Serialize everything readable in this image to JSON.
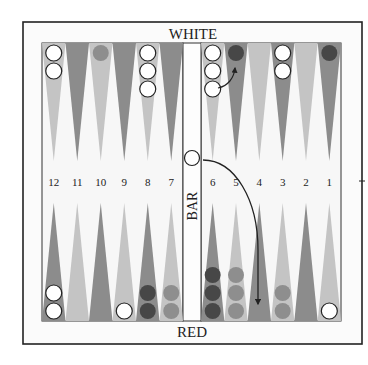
{
  "labels": {
    "top_player": "WHITE",
    "bottom_player": "RED",
    "bar": "BAR"
  },
  "point_numbers": [
    "12",
    "11",
    "10",
    "9",
    "8",
    "7",
    "6",
    "5",
    "4",
    "3",
    "2",
    "1"
  ],
  "colors": {
    "frame": "#222222",
    "board_bg": "#f7f7f7",
    "triangle_light": "#c4c4c4",
    "triangle_dark": "#8c8c8c",
    "checker_white": "#ffffff",
    "checker_dark": "#474747",
    "checker_gray": "#8e8e8e"
  },
  "top_points": [
    {
      "point": 13,
      "shade": "light",
      "checkers": {
        "color": "white",
        "count": 2
      }
    },
    {
      "point": 14,
      "shade": "dark",
      "checkers": {
        "color": "none",
        "count": 0
      }
    },
    {
      "point": 15,
      "shade": "light",
      "checkers": {
        "color": "gray",
        "count": 1
      }
    },
    {
      "point": 16,
      "shade": "dark",
      "checkers": {
        "color": "none",
        "count": 0
      }
    },
    {
      "point": 17,
      "shade": "light",
      "checkers": {
        "color": "white",
        "count": 3
      }
    },
    {
      "point": 18,
      "shade": "dark",
      "checkers": {
        "color": "none",
        "count": 0
      }
    },
    {
      "point": 19,
      "shade": "light",
      "checkers": {
        "color": "white",
        "count": 3
      }
    },
    {
      "point": 20,
      "shade": "dark",
      "checkers": {
        "color": "dark",
        "count": 1
      }
    },
    {
      "point": 21,
      "shade": "light",
      "checkers": {
        "color": "none",
        "count": 0
      }
    },
    {
      "point": 22,
      "shade": "dark",
      "checkers": {
        "color": "white",
        "count": 2
      }
    },
    {
      "point": 23,
      "shade": "light",
      "checkers": {
        "color": "none",
        "count": 0
      }
    },
    {
      "point": 24,
      "shade": "dark",
      "checkers": {
        "color": "dark",
        "count": 1
      }
    }
  ],
  "bottom_points": [
    {
      "point": 12,
      "shade": "dark",
      "checkers": {
        "color": "white",
        "count": 2
      }
    },
    {
      "point": 11,
      "shade": "light",
      "checkers": {
        "color": "none",
        "count": 0
      }
    },
    {
      "point": 10,
      "shade": "dark",
      "checkers": {
        "color": "none",
        "count": 0
      }
    },
    {
      "point": 9,
      "shade": "light",
      "checkers": {
        "color": "white",
        "count": 1
      }
    },
    {
      "point": 8,
      "shade": "dark",
      "checkers": {
        "color": "dark",
        "count": 2
      }
    },
    {
      "point": 7,
      "shade": "light",
      "checkers": {
        "color": "gray",
        "count": 2
      }
    },
    {
      "point": 6,
      "shade": "dark",
      "checkers": {
        "color": "dark",
        "count": 3
      }
    },
    {
      "point": 5,
      "shade": "light",
      "checkers": {
        "color": "gray",
        "count": 3
      }
    },
    {
      "point": 4,
      "shade": "dark",
      "checkers": {
        "color": "none",
        "count": 0
      }
    },
    {
      "point": 3,
      "shade": "light",
      "checkers": {
        "color": "gray",
        "count": 2
      }
    },
    {
      "point": 2,
      "shade": "dark",
      "checkers": {
        "color": "none",
        "count": 0
      }
    },
    {
      "point": 1,
      "shade": "light",
      "checkers": {
        "color": "white",
        "count": 1
      }
    }
  ],
  "bar_checkers": [
    {
      "color": "white",
      "count": 1
    }
  ],
  "moves": [
    {
      "from": "bar",
      "to": "4",
      "description": "curved arrow from bar checker to point 4"
    },
    {
      "from": "19",
      "to": "20",
      "description": "short curved arrow from point 19 checker to point 20"
    }
  ]
}
